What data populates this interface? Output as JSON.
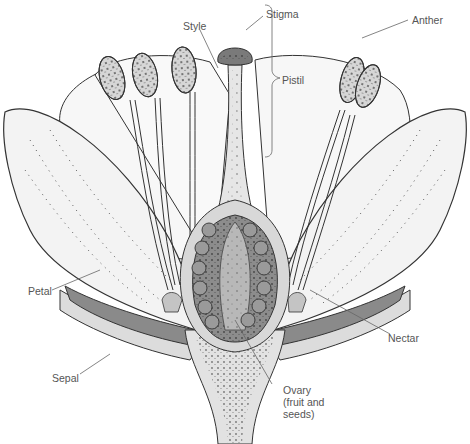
{
  "diagram": {
    "colors": {
      "outline": "#333333",
      "petal_fill": "#f4f4f4",
      "sepal_fill": "#8a8a8a",
      "sepal_rim": "#dcdcdc",
      "ovary_wall": "#8c8c8c",
      "ovule_fill": "#9a9a9a",
      "ovary_core": "#b8b8b8",
      "stem_fill": "#e2e2e2",
      "anther_fill": "#d6d6d6",
      "label_text": "#555555",
      "leader_line": "#666666"
    },
    "labels": {
      "stigma": "Stigma",
      "style": "Style",
      "anther": "Anther",
      "pistil": "Pistil",
      "petal": "Petal",
      "sepal": "Sepal",
      "nectar": "Nectar",
      "ovary": "Ovary\n(fruit and\nseeds)"
    }
  }
}
